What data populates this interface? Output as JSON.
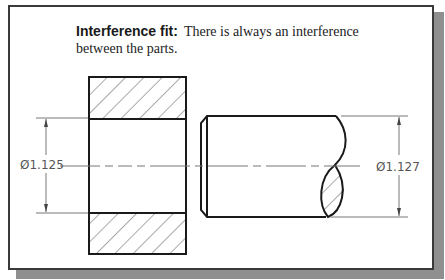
{
  "caption": {
    "term": "Interference fit:",
    "description": "There is always an interference between the parts."
  },
  "dimensions": {
    "hole": {
      "label": "Ø1.125",
      "value": 1.125,
      "feature": "hole"
    },
    "shaft": {
      "label": "Ø1.127",
      "value": 1.127,
      "feature": "shaft"
    }
  },
  "colors": {
    "outline": "#1a1a1a",
    "dimension_line": "#777777",
    "hatch": "#555555",
    "frame_shadow": "#8f8f8f"
  }
}
